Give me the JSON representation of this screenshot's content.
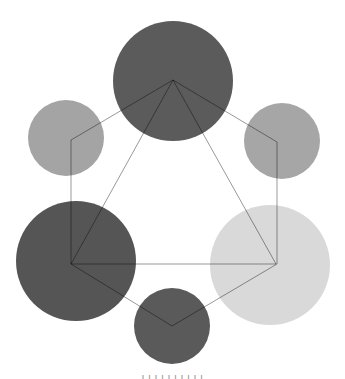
{
  "diagram": {
    "title": "",
    "background": "#ffffff",
    "circles": [
      {
        "id": "top",
        "cx": 173,
        "cy": 81,
        "r": 60,
        "fill": "#5b5b5b",
        "label": ""
      },
      {
        "id": "upper-left",
        "cx": 66,
        "cy": 138,
        "r": 38,
        "fill": "#a4a4a4",
        "label": ""
      },
      {
        "id": "upper-right",
        "cx": 282,
        "cy": 141,
        "r": 38,
        "fill": "#a6a6a6",
        "label": ""
      },
      {
        "id": "lower-left",
        "cx": 76,
        "cy": 261,
        "r": 60,
        "fill": "#555555",
        "label": ""
      },
      {
        "id": "lower-right",
        "cx": 270,
        "cy": 265,
        "r": 60,
        "fill": "#d9d9d9",
        "label": ""
      },
      {
        "id": "bottom",
        "cx": 172,
        "cy": 326,
        "r": 38,
        "fill": "#5a5a5a",
        "label": ""
      }
    ],
    "hexagon": {
      "points": [
        [
          173,
          80
        ],
        [
          277,
          142
        ],
        [
          277,
          264
        ],
        [
          172,
          326
        ],
        [
          71,
          264
        ],
        [
          71,
          140
        ]
      ],
      "stroke": "#000000",
      "stroke_opacity": 0.4,
      "stroke_width": 1
    },
    "triangle": {
      "points": [
        [
          173,
          80
        ],
        [
          71,
          264
        ],
        [
          276,
          264
        ]
      ],
      "stroke": "#000000",
      "stroke_opacity": 0.4,
      "stroke_width": 1
    }
  },
  "caption": {
    "text": "l   l   l  l  l    l   l    l   l   l"
  }
}
